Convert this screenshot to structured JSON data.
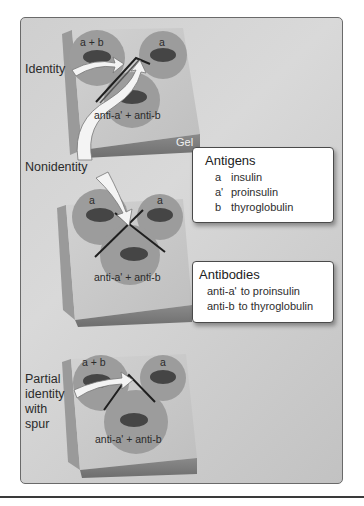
{
  "figure": {
    "panels": [
      {
        "id": "identity",
        "label": "Identity",
        "wells": {
          "top_left": "a + b",
          "top_right": "a",
          "bottom": "anti-a' + anti-b"
        },
        "slab_label": "Gel"
      },
      {
        "id": "nonidentity",
        "label": "Nonidentity",
        "wells": {
          "top_left": "a",
          "top_right": "a",
          "bottom": "anti-a' + anti-b"
        }
      },
      {
        "id": "partial",
        "label_lines": [
          "Partial",
          "identity",
          "with",
          "spur"
        ],
        "wells": {
          "top_left": "a + b",
          "top_right": "a",
          "bottom": "anti-a' + anti-b"
        }
      }
    ],
    "legend": {
      "antigens": {
        "title": "Antigens",
        "items": [
          {
            "key": "a",
            "value": "insulin"
          },
          {
            "key": "a'",
            "value": "proinsulin"
          },
          {
            "key": "b",
            "value": "thyroglobulin"
          }
        ]
      },
      "antibodies": {
        "title": "Antibodies",
        "items": [
          {
            "key": "anti-a'",
            "value": "to proinsulin"
          },
          {
            "key": "anti-b",
            "value": "to thyroglobulin"
          }
        ]
      }
    },
    "colors": {
      "panel_bg": "#d3d3d3",
      "gel_top": "#c9c9c9",
      "gel_side": "#8f8f8f",
      "gel_front": "#7a7a7a",
      "well_ring": "#9b9b9b",
      "well_hole": "#4a4a4a",
      "precipitin_line": "#222222",
      "arrow_fill": "#f4f4f4"
    }
  }
}
